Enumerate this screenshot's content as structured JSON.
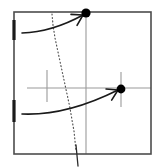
{
  "figure": {
    "title": "",
    "caption": "",
    "background_color": "#ffffff"
  },
  "colors": {
    "frame": "#4d4d4d",
    "axis_gray": "#9a9a9a",
    "marker": "#000000",
    "arrow": "#1a1a1a",
    "dotted": "#555555",
    "tick_black": "#1a1a1a"
  },
  "chart_data": {
    "type": "scatter",
    "title": "",
    "xlabel": "",
    "ylabel": "",
    "grid": false,
    "legend": null,
    "xlim": [
      0,
      161
    ],
    "ylim": [
      0,
      168
    ],
    "frame": {
      "name": "plot-frame",
      "x": 14,
      "y": 12,
      "width": 137,
      "height": 142,
      "stroke_width": 1.6
    },
    "points": [
      {
        "name": "marker-top",
        "label": "",
        "x": 86,
        "y": 13,
        "radius": 4.6,
        "on_frame_edge": "top"
      },
      {
        "name": "marker-right",
        "label": "",
        "x": 121,
        "y": 89,
        "radius": 4.4,
        "on_frame_edge": "interior"
      }
    ],
    "gray_guides": [
      {
        "name": "horizontal-axis-line",
        "orientation": "horizontal",
        "x1": 27,
        "y1": 88,
        "x2": 151,
        "y2": 88,
        "stroke_width": 1.1
      },
      {
        "name": "vertical-line-through-top-marker",
        "orientation": "vertical",
        "x1": 86,
        "y1": 13,
        "x2": 86,
        "y2": 154,
        "stroke_width": 1.1
      },
      {
        "name": "short-vertical-tick-left",
        "orientation": "vertical",
        "x1": 47,
        "y1": 70,
        "x2": 47,
        "y2": 102,
        "stroke_width": 1.1
      },
      {
        "name": "short-vertical-tick-right-marker",
        "orientation": "vertical",
        "x1": 121,
        "y1": 72,
        "x2": 121,
        "y2": 107,
        "stroke_width": 1.1
      }
    ],
    "black_edge_ticks": [
      {
        "name": "left-edge-tick-upper",
        "x": 14,
        "y1": 20,
        "y2": 40,
        "stroke_width": 3.2
      },
      {
        "name": "left-edge-tick-lower",
        "x": 14,
        "y1": 100,
        "y2": 122,
        "stroke_width": 3.2
      }
    ],
    "dotted_curve": {
      "name": "dotted-separatrix",
      "style": "dotted",
      "stroke_width": 1.2,
      "points": [
        [
          52,
          14
        ],
        [
          53,
          25
        ],
        [
          55,
          38
        ],
        [
          58,
          52
        ],
        [
          61,
          66
        ],
        [
          64,
          80
        ],
        [
          67,
          94
        ],
        [
          70,
          108
        ],
        [
          72,
          120
        ],
        [
          74,
          131
        ],
        [
          75,
          141
        ],
        [
          76,
          151
        ]
      ],
      "solid_tail": [
        [
          76,
          145
        ],
        [
          78,
          166
        ]
      ]
    },
    "arrows": [
      {
        "name": "arrow-upper",
        "from": [
          22,
          33
        ],
        "to": [
          83,
          15
        ],
        "control": [
          52,
          32
        ],
        "stroke_width": 1.6,
        "head": true
      },
      {
        "name": "arrow-lower",
        "from": [
          22,
          114
        ],
        "to": [
          118,
          90
        ],
        "control": [
          66,
          116
        ],
        "stroke_width": 1.6,
        "head": true
      }
    ]
  }
}
